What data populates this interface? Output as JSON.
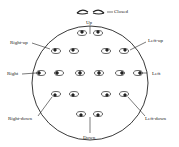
{
  "diagram": {
    "labels": {
      "closed": "Closed",
      "up": "Up",
      "right_up": "Right-up",
      "left_up": "Left-up",
      "right": "Right",
      "left": "Left",
      "right_down": "Right-down",
      "left_down": "Left-down",
      "down": "Down"
    },
    "colors": {
      "stroke": "#222222",
      "background": "#ffffff"
    }
  }
}
